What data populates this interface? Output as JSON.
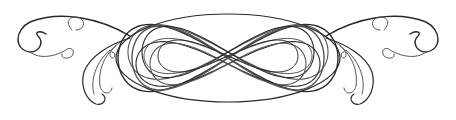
{
  "image": {
    "description": "Symmetric calligraphic scroll ornament with interlaced central loops and acanthus flourishes on both ends",
    "ink_color": "#2a2a2a",
    "background_color": "#ffffff"
  }
}
